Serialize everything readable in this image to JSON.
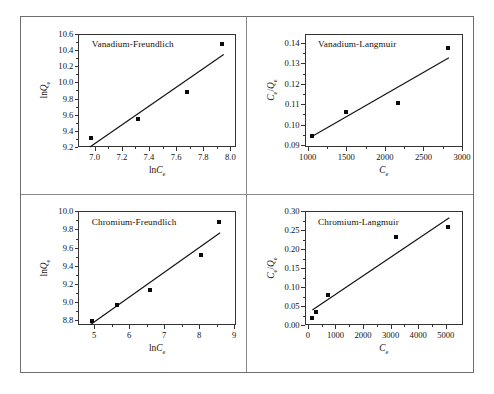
{
  "figure": {
    "layout": "2x2 grid of scatter plots with linear fit lines",
    "panel_order": [
      "Vanadium-Freundlich",
      "Vanadium-Langmuir",
      "Chromium-Freundlich",
      "Chromium-Langmuir"
    ]
  },
  "chart_data": [
    {
      "type": "scatter",
      "title": "Vanadium-Freundlich",
      "xlabel": "lnCe",
      "ylabel": "lnQe",
      "xlim": [
        6.88,
        8.04
      ],
      "ylim": [
        9.2,
        10.6
      ],
      "xticks": [
        7.0,
        7.2,
        7.4,
        7.6,
        7.8,
        8.0
      ],
      "xtick_labels": [
        "7.0",
        "7.2",
        "7.4",
        "7.6",
        "7.8",
        "8.0"
      ],
      "yticks": [
        9.2,
        9.4,
        9.6,
        9.8,
        10.0,
        10.2,
        10.4,
        10.6
      ],
      "ytick_labels": [
        "9.2",
        "9.4",
        "9.6",
        "9.8",
        "10.0",
        "10.2",
        "10.4",
        "10.6"
      ],
      "x": [
        6.97,
        7.32,
        7.68,
        7.94
      ],
      "y": [
        9.31,
        9.55,
        9.88,
        10.48
      ],
      "fit_line": {
        "x1": 6.965,
        "y1": 9.2,
        "x2": 7.95,
        "y2": 10.345
      },
      "grid": false,
      "legend": "none"
    },
    {
      "type": "scatter",
      "title": "Vanadium-Langmuir",
      "xlabel": "Ce",
      "ylabel": "Ce/Qe",
      "xlim": [
        960,
        3010
      ],
      "ylim": [
        0.089,
        0.1445
      ],
      "xticks": [
        1000,
        1500,
        2000,
        2500,
        3000
      ],
      "xtick_labels": [
        "1000",
        "1500",
        "2000",
        "2500",
        "3000"
      ],
      "yticks": [
        0.09,
        0.1,
        0.11,
        0.12,
        0.13,
        0.14
      ],
      "ytick_labels": [
        "0.09",
        "0.10",
        "0.11",
        "0.12",
        "0.13",
        "0.14"
      ],
      "x": [
        1060,
        1500,
        2170,
        2820
      ],
      "y": [
        0.0945,
        0.106,
        0.1105,
        0.1375
      ],
      "fit_line": {
        "x1": 1060,
        "y1": 0.0943,
        "x2": 2830,
        "y2": 0.1328
      },
      "grid": false,
      "legend": "none"
    },
    {
      "type": "scatter",
      "title": "Chromium-Freundlich",
      "xlabel": "lnCe",
      "ylabel": "lnQe",
      "xlim": [
        4.55,
        9.05
      ],
      "ylim": [
        8.74,
        10.0
      ],
      "xticks": [
        5,
        6,
        7,
        8,
        9
      ],
      "xtick_labels": [
        "5",
        "6",
        "7",
        "8",
        "9"
      ],
      "yticks": [
        8.8,
        9.0,
        9.2,
        9.4,
        9.6,
        9.8,
        10.0
      ],
      "ytick_labels": [
        "8.8",
        "9.0",
        "9.2",
        "9.4",
        "9.6",
        "9.8",
        "10.0"
      ],
      "x": [
        4.93,
        5.66,
        6.6,
        8.06,
        8.57
      ],
      "y": [
        8.79,
        8.96,
        9.135,
        9.52,
        9.88
      ],
      "fit_line": {
        "x1": 4.9,
        "y1": 8.755,
        "x2": 8.6,
        "y2": 9.77
      },
      "grid": false,
      "legend": "none"
    },
    {
      "type": "scatter",
      "title": "Chromium-Langmuir",
      "xlabel": "Ce",
      "ylabel": "Ce/Qe",
      "xlim": [
        -120,
        5620
      ],
      "ylim": [
        0.0,
        0.3
      ],
      "xticks": [
        0,
        1000,
        2000,
        3000,
        4000,
        5000
      ],
      "xtick_labels": [
        "0",
        "1000",
        "2000",
        "3000",
        "4000",
        "5000"
      ],
      "yticks": [
        0.0,
        0.05,
        0.1,
        0.15,
        0.2,
        0.25,
        0.3
      ],
      "ytick_labels": [
        "0.00",
        "0.05",
        "0.10",
        "0.15",
        "0.20",
        "0.25",
        "0.30"
      ],
      "x": [
        140,
        310,
        740,
        3200,
        5100
      ],
      "y": [
        0.018,
        0.035,
        0.081,
        0.233,
        0.259
      ],
      "fit_line": {
        "x1": 160,
        "y1": 0.0415,
        "x2": 5130,
        "y2": 0.2845
      },
      "grid": false,
      "legend": "none"
    }
  ]
}
